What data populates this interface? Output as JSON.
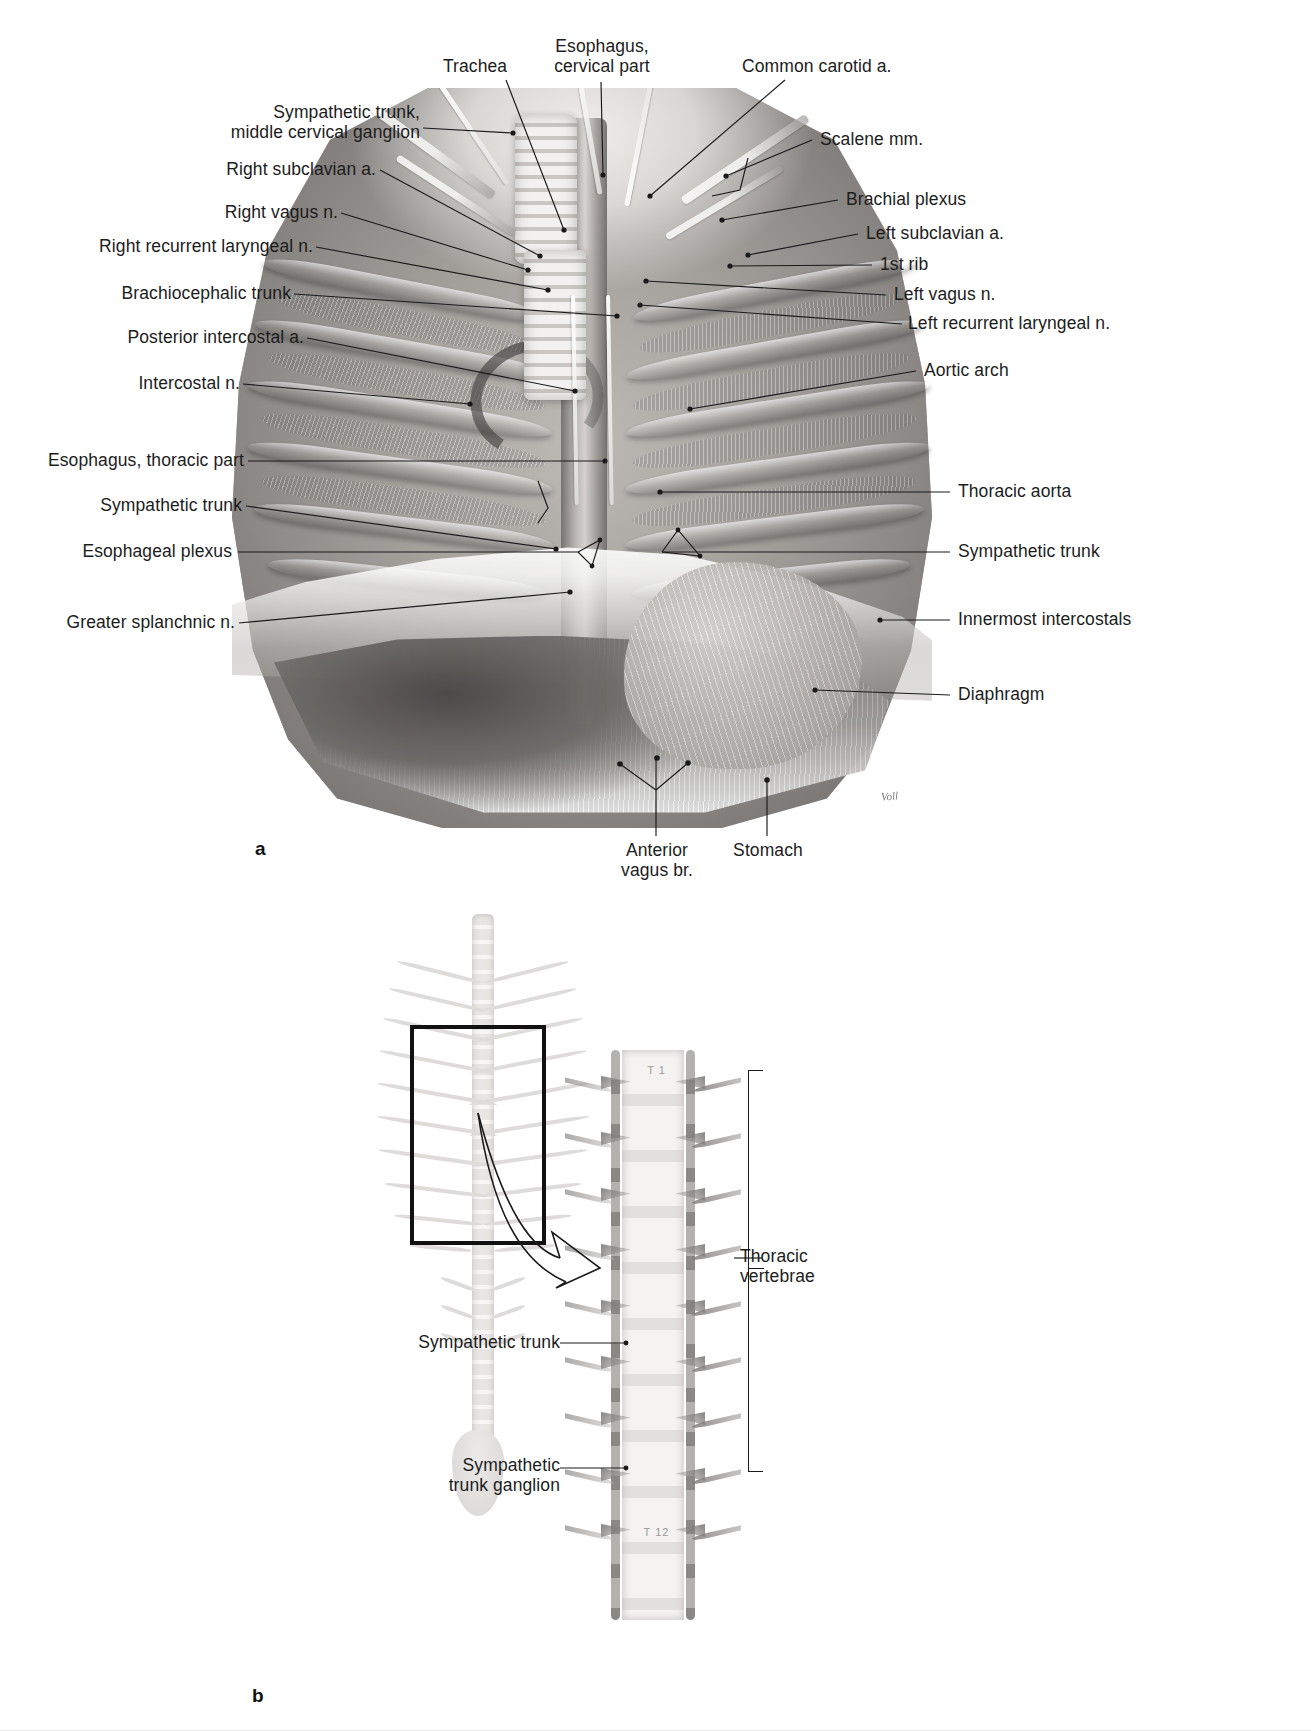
{
  "figure_a": {
    "panel_letter": "a",
    "labels_top": [
      {
        "id": "trachea",
        "text": "Trachea"
      },
      {
        "id": "esophagus-cervical",
        "text": "Esophagus,\ncervical part"
      },
      {
        "id": "common-carotid",
        "text": "Common carotid a."
      }
    ],
    "labels_left": [
      {
        "id": "sympathetic-trunk-mcg",
        "text": "Sympathetic trunk,\nmiddle cervical ganglion"
      },
      {
        "id": "right-subclavian",
        "text": "Right subclavian a."
      },
      {
        "id": "right-vagus",
        "text": "Right vagus n."
      },
      {
        "id": "right-recurrent-laryngeal",
        "text": "Right recurrent laryngeal n."
      },
      {
        "id": "brachiocephalic-trunk",
        "text": "Brachiocephalic trunk"
      },
      {
        "id": "posterior-intercostal",
        "text": "Posterior intercostal a."
      },
      {
        "id": "intercostal-n",
        "text": "Intercostal n."
      },
      {
        "id": "esophagus-thoracic",
        "text": "Esophagus, thoracic part"
      },
      {
        "id": "sympathetic-trunk-left",
        "text": "Sympathetic trunk"
      },
      {
        "id": "esophageal-plexus",
        "text": "Esophageal plexus"
      },
      {
        "id": "greater-splanchnic",
        "text": "Greater splanchnic n."
      }
    ],
    "labels_right": [
      {
        "id": "scalene-mm",
        "text": "Scalene mm."
      },
      {
        "id": "brachial-plexus",
        "text": "Brachial plexus"
      },
      {
        "id": "left-subclavian",
        "text": "Left subclavian a."
      },
      {
        "id": "first-rib",
        "text": "1st rib"
      },
      {
        "id": "left-vagus",
        "text": "Left vagus n."
      },
      {
        "id": "left-recurrent-laryngeal",
        "text": "Left recurrent laryngeal n."
      },
      {
        "id": "aortic-arch",
        "text": "Aortic arch"
      },
      {
        "id": "thoracic-aorta",
        "text": "Thoracic aorta"
      },
      {
        "id": "sympathetic-trunk-right",
        "text": "Sympathetic trunk"
      },
      {
        "id": "innermost-intercostals",
        "text": "Innermost intercostals"
      },
      {
        "id": "diaphragm",
        "text": "Diaphragm"
      }
    ],
    "labels_bottom": [
      {
        "id": "anterior-vagus-br",
        "text": "Anterior\nvagus br."
      },
      {
        "id": "stomach",
        "text": "Stomach"
      }
    ],
    "artist_signature": "Voll"
  },
  "figure_b": {
    "panel_letter": "b",
    "labels": [
      {
        "id": "thoracic-vertebrae",
        "text": "Thoracic\nvertebrae"
      },
      {
        "id": "sympathetic-trunk",
        "text": "Sympathetic trunk"
      },
      {
        "id": "sympathetic-trunk-ganglion",
        "text": "Sympathetic\ntrunk ganglion"
      }
    ],
    "vertebra_markers": [
      "T 1",
      "T 12"
    ]
  },
  "colors": {
    "ink": "#1a1a1a",
    "background": "#ffffff",
    "leader_line": "#1a1a1a",
    "box_outline": "#111111"
  }
}
